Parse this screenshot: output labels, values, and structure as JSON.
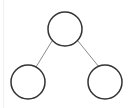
{
  "diagram": {
    "type": "tree",
    "colors": {
      "background": "#ffffff",
      "node_stroke": "#333333",
      "edge_stroke": "#8a8a8a",
      "left_rule": "#f0f0f0"
    },
    "nodes": [
      {
        "id": "root",
        "cx": 65,
        "cy": 29,
        "r": 17,
        "label": ""
      },
      {
        "id": "left-child",
        "cx": 28,
        "cy": 82,
        "r": 17,
        "label": ""
      },
      {
        "id": "right-child",
        "cx": 105,
        "cy": 82,
        "r": 17,
        "label": ""
      }
    ],
    "edges": [
      {
        "from": "root",
        "to": "left-child",
        "x1": 52,
        "y1": 41,
        "x2": 36,
        "y2": 67
      },
      {
        "from": "root",
        "to": "right-child",
        "x1": 78,
        "y1": 41,
        "x2": 99,
        "y2": 67
      }
    ]
  }
}
